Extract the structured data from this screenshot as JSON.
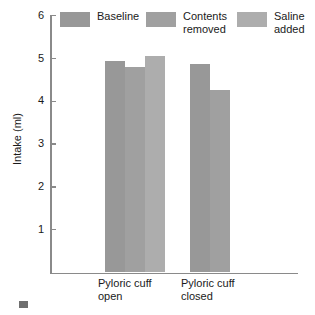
{
  "chart_data": {
    "type": "bar",
    "title": "",
    "xlabel": "",
    "ylabel": "Intake (ml)",
    "ylim": [
      0,
      6
    ],
    "yticks": [
      1,
      2,
      3,
      4,
      5,
      6
    ],
    "ytick_labels": [
      "1",
      "2",
      "3",
      "4",
      "5",
      "6"
    ],
    "grid": false,
    "legend_position": "top",
    "categories": [
      "Pyloric cuff open",
      "Pyloric cuff closed"
    ],
    "category_lines": [
      [
        "Pyloric cuff",
        "open"
      ],
      [
        "Pyloric cuff",
        "closed"
      ]
    ],
    "series": [
      {
        "name": "Baseline",
        "color": "#989898",
        "values": [
          4.94,
          4.86
        ]
      },
      {
        "name": "Contents removed",
        "color": "#a0a0a0",
        "values": [
          4.79,
          4.27
        ]
      },
      {
        "name": "Saline added",
        "color": "#adadad",
        "values": [
          5.07,
          null
        ]
      }
    ]
  },
  "axes": {
    "y_title": "Intake (ml)",
    "ticks": [
      {
        "label": "6",
        "value": 6
      },
      {
        "label": "5",
        "value": 5
      },
      {
        "label": "4",
        "value": 4
      },
      {
        "label": "3",
        "value": 3
      },
      {
        "label": "2",
        "value": 2
      },
      {
        "label": "1",
        "value": 1
      }
    ]
  },
  "legend": {
    "items": [
      {
        "label": "Baseline",
        "color": "#989898"
      },
      {
        "label": "Contents\nremoved",
        "color": "#a0a0a0"
      },
      {
        "label": "Saline\nadded",
        "color": "#adadad"
      }
    ]
  },
  "colors": {
    "axis": "#8a8a8a",
    "text": "#1a1a1a",
    "background": "#ffffff",
    "corner_mark": "#6f6f6f"
  }
}
